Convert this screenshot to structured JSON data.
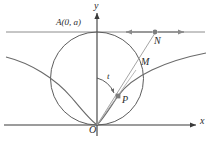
{
  "figure": {
    "type": "geometry-diagram",
    "background_color": "#ffffff",
    "stroke_color": "#4a4a4a",
    "axis_color": "#3a3a3a",
    "point_color": "#777777",
    "labels": {
      "y_axis": "y",
      "x_axis": "x",
      "origin": "O",
      "point_A": "A(0, a)",
      "point_N": "N",
      "point_M": "M",
      "point_P": "P",
      "angle_t": "t"
    },
    "points": {
      "O": {
        "x": 97,
        "y": 125
      },
      "A": {
        "x": 97,
        "y": 32
      },
      "N": {
        "x": 155,
        "y": 32
      },
      "M": {
        "x": 134,
        "y": 72
      },
      "P": {
        "x": 118,
        "y": 96
      }
    },
    "circle": {
      "cx": 97,
      "cy": 78.5,
      "r": 46.5
    },
    "horizontal_line_y": 32,
    "x_axis_y": 125,
    "y_axis_x": 97,
    "arrows": {
      "n_arrow_left_end": 124,
      "n_arrow_right_end": 186,
      "x_axis_arrow_tip": 198,
      "y_axis_arrow_tip": 10
    }
  }
}
